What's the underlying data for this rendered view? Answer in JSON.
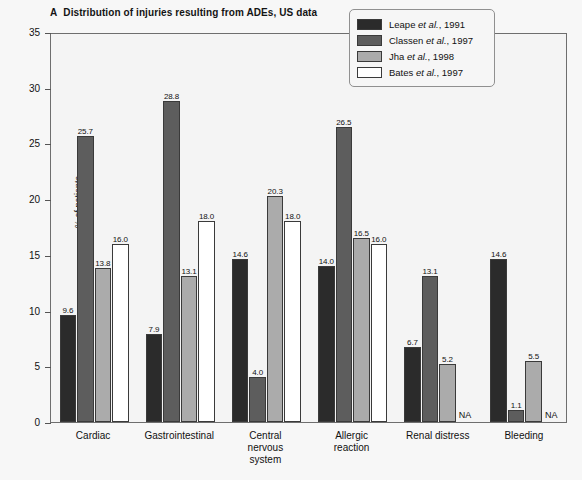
{
  "title": {
    "panel_letter": "A",
    "text": "Distribution of injuries resulting from ADEs, US data"
  },
  "axes": {
    "ylabel": "% of patients",
    "yticks": [
      "0",
      "5",
      "10",
      "15",
      "20",
      "25",
      "30",
      "35"
    ]
  },
  "legend": {
    "entries": [
      {
        "author": "Leape",
        "etal": "et al.",
        "year": ", 1991",
        "color": "#2b2b2b"
      },
      {
        "author": "Classen",
        "etal": "et al.",
        "year": ", 1997",
        "color": "#5d5d5d"
      },
      {
        "author": "Jha",
        "etal": "et al.",
        "year": ", 1998",
        "color": "#ababab"
      },
      {
        "author": "Bates",
        "etal": "et al.",
        "year": ", 1997",
        "color": "#ffffff"
      }
    ]
  },
  "na_text": "NA",
  "chart_data": {
    "type": "bar",
    "xlabel": "",
    "ylabel": "% of patients",
    "ylim": [
      0,
      35
    ],
    "yticks": [
      0,
      5,
      10,
      15,
      20,
      25,
      30,
      35
    ],
    "grid": false,
    "legend_position": "top-right",
    "categories": [
      "Cardiac",
      "Gastrointestinal",
      "Central nervous system",
      "Allergic reaction",
      "Renal distress",
      "Bleeding"
    ],
    "series": [
      {
        "name": "Leape et al., 1991",
        "color": "#2b2b2b",
        "values": [
          9.6,
          7.9,
          14.6,
          14.0,
          6.7,
          14.6
        ],
        "labels": [
          "9.6",
          "7.9",
          "14.6",
          "14.0",
          "6.7",
          "14.6"
        ]
      },
      {
        "name": "Classen et al., 1997",
        "color": "#5d5d5d",
        "values": [
          25.7,
          28.8,
          4.0,
          26.5,
          13.1,
          1.1
        ],
        "labels": [
          "25.7",
          "28.8",
          "4.0",
          "26.5",
          "13.1",
          "1.1"
        ]
      },
      {
        "name": "Jha et al., 1998",
        "color": "#ababab",
        "values": [
          13.8,
          13.1,
          20.3,
          16.5,
          5.2,
          5.5
        ],
        "labels": [
          "13.8",
          "13.1",
          "20.3",
          "16.5",
          "5.2",
          "5.5"
        ]
      },
      {
        "name": "Bates et al., 1997",
        "color": "#ffffff",
        "values": [
          16.0,
          18.0,
          18.0,
          16.0,
          null,
          null
        ],
        "labels": [
          "16.0",
          "18.0",
          "18.0",
          "16.0",
          "NA",
          "NA"
        ]
      }
    ]
  }
}
